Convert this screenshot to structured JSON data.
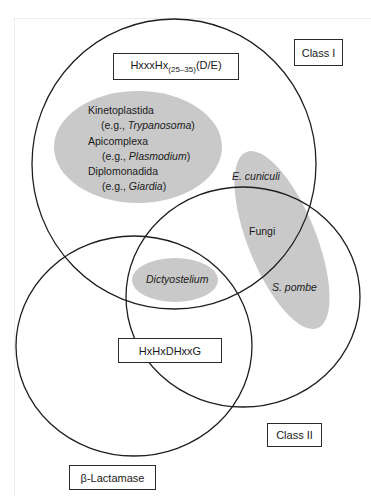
{
  "diagram": {
    "type": "venn",
    "sets": [
      {
        "id": "class-1",
        "label": "Class I",
        "motif": {
          "prefix": "HxxxHx",
          "subscript": "(25–35)",
          "suffix": "(D/E)"
        }
      },
      {
        "id": "class-2",
        "label": "Class II"
      },
      {
        "id": "beta-lactamase",
        "label": "β-Lactamase"
      }
    ],
    "shared_motif": "HxHxDHxxG",
    "groups": {
      "protozoa": {
        "lines": [
          {
            "name": "Kinetoplastida",
            "example_prefix": "(e.g., ",
            "example": "Trypanosoma",
            "example_suffix": ")"
          },
          {
            "name": "Apicomplexa",
            "example_prefix": "(e.g., ",
            "example": "Plasmodium",
            "example_suffix": ")"
          },
          {
            "name": "Diplomonadida",
            "example_prefix": "(e.g., ",
            "example": "Giardia",
            "example_suffix": ")"
          }
        ]
      },
      "fungi": {
        "label": "Fungi",
        "top_species": "E. cuniculi",
        "bottom_species": "S. pombe"
      },
      "dictyostelium": {
        "label": "Dictyostelium"
      }
    },
    "colors": {
      "stroke": "#1e1e1e",
      "group_fill": "#c9c9c9",
      "background": "#ffffff"
    }
  }
}
